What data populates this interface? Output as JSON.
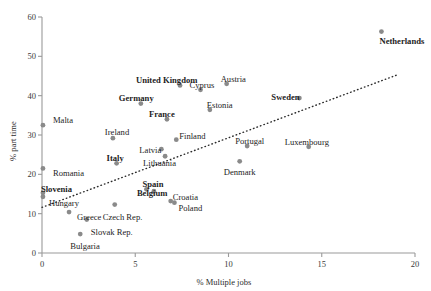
{
  "chart_data": {
    "type": "scatter",
    "title": "",
    "xlabel": "%  Multiple jobs",
    "ylabel": "%  part time",
    "xlim": [
      0,
      20
    ],
    "ylim": [
      0,
      60
    ],
    "xticks": [
      0,
      5,
      10,
      15,
      20
    ],
    "yticks": [
      0,
      10,
      20,
      30,
      40,
      50,
      60
    ],
    "grid": false,
    "legend": "none",
    "marker_color": "#8a8a8a",
    "text_color": "#1d1d1d",
    "axis_color": "#9a9a9a",
    "trendline": {
      "style": "dotted",
      "color": "#2b2b2b",
      "x_start": 0.0,
      "y_start": 11.6,
      "x_end": 19.0,
      "y_end": 45.2
    },
    "points": [
      {
        "name": "Malta",
        "x": 0.05,
        "y": 32.5,
        "bold": false,
        "label_dx": 10,
        "label_dy": -9
      },
      {
        "name": "Romania",
        "x": 0.05,
        "y": 21.5,
        "bold": false,
        "label_dx": 10,
        "label_dy": 1
      },
      {
        "name": "Slovenia",
        "x": 0.05,
        "y": 15.3,
        "bold": true,
        "label_dx": -2,
        "label_dy": -8
      },
      {
        "name": "Hungary",
        "x": 0.05,
        "y": 14.3,
        "bold": false,
        "label_dx": 6,
        "label_dy": 2
      },
      {
        "name": "Greece",
        "x": 1.45,
        "y": 10.4,
        "bold": false,
        "label_dx": 8,
        "label_dy": 1
      },
      {
        "name": "Bulgaria",
        "x": 2.05,
        "y": 4.8,
        "bold": false,
        "label_dx": -10,
        "label_dy": 8
      },
      {
        "name": "Slovak Rep.",
        "x": 2.4,
        "y": 8.5,
        "bold": false,
        "label_dx": 4,
        "label_dy": 8
      },
      {
        "name": "Ireland",
        "x": 3.8,
        "y": 29.2,
        "bold": false,
        "label_dx": -8,
        "label_dy": -10
      },
      {
        "name": "Italy",
        "x": 4.0,
        "y": 22.8,
        "bold": true,
        "label_dx": -10,
        "label_dy": -9
      },
      {
        "name": "Germany",
        "x": 5.3,
        "y": 38.0,
        "bold": true,
        "label_dx": -22,
        "label_dy": -10
      },
      {
        "name": "Czech Rep.",
        "x": 3.9,
        "y": 12.3,
        "bold": false,
        "label_dx": -12,
        "label_dy": 8
      },
      {
        "name": "Spain",
        "x": 5.6,
        "y": 16.2,
        "bold": true,
        "label_dx": -4,
        "label_dy": -9
      },
      {
        "name": "Belgium",
        "x": 6.0,
        "y": 15.7,
        "bold": true,
        "label_dx": -17,
        "label_dy": -2
      },
      {
        "name": "Lithuania",
        "x": 6.6,
        "y": 24.6,
        "bold": false,
        "label_dx": -22,
        "label_dy": 3
      },
      {
        "name": "Latvia",
        "x": 6.4,
        "y": 26.4,
        "bold": false,
        "label_dx": -22,
        "label_dy": -3
      },
      {
        "name": "France",
        "x": 6.7,
        "y": 34.0,
        "bold": true,
        "label_dx": -18,
        "label_dy": -9
      },
      {
        "name": "United Kingdom",
        "x": 7.4,
        "y": 42.6,
        "bold": true,
        "label_dx": -44,
        "label_dy": -9
      },
      {
        "name": "Finland",
        "x": 7.2,
        "y": 28.8,
        "bold": false,
        "label_dx": 3,
        "label_dy": -8
      },
      {
        "name": "Croatia",
        "x": 6.9,
        "y": 13.2,
        "bold": false,
        "label_dx": 2,
        "label_dy": -8
      },
      {
        "name": "Poland",
        "x": 7.1,
        "y": 12.8,
        "bold": false,
        "label_dx": 4,
        "label_dy": 1
      },
      {
        "name": "Cyprus",
        "x": 8.5,
        "y": 41.5,
        "bold": false,
        "label_dx": -11,
        "label_dy": -9
      },
      {
        "name": "Estonia",
        "x": 9.0,
        "y": 36.4,
        "bold": false,
        "label_dx": -3,
        "label_dy": -9
      },
      {
        "name": "Austria",
        "x": 9.9,
        "y": 43.0,
        "bold": false,
        "label_dx": -6,
        "label_dy": -9
      },
      {
        "name": "Denmark",
        "x": 10.6,
        "y": 23.3,
        "bold": false,
        "label_dx": -16,
        "label_dy": 7
      },
      {
        "name": "Portugal",
        "x": 11.0,
        "y": 27.2,
        "bold": false,
        "label_dx": -12,
        "label_dy": -9
      },
      {
        "name": "Sweden",
        "x": 13.8,
        "y": 39.4,
        "bold": true,
        "label_dx": -28,
        "label_dy": -5
      },
      {
        "name": "Luxembourg",
        "x": 14.3,
        "y": 27.0,
        "bold": false,
        "label_dx": -24,
        "label_dy": -9
      },
      {
        "name": "Netherlands",
        "x": 18.2,
        "y": 56.3,
        "bold": true,
        "label_dx": -2,
        "label_dy": 5
      }
    ]
  }
}
